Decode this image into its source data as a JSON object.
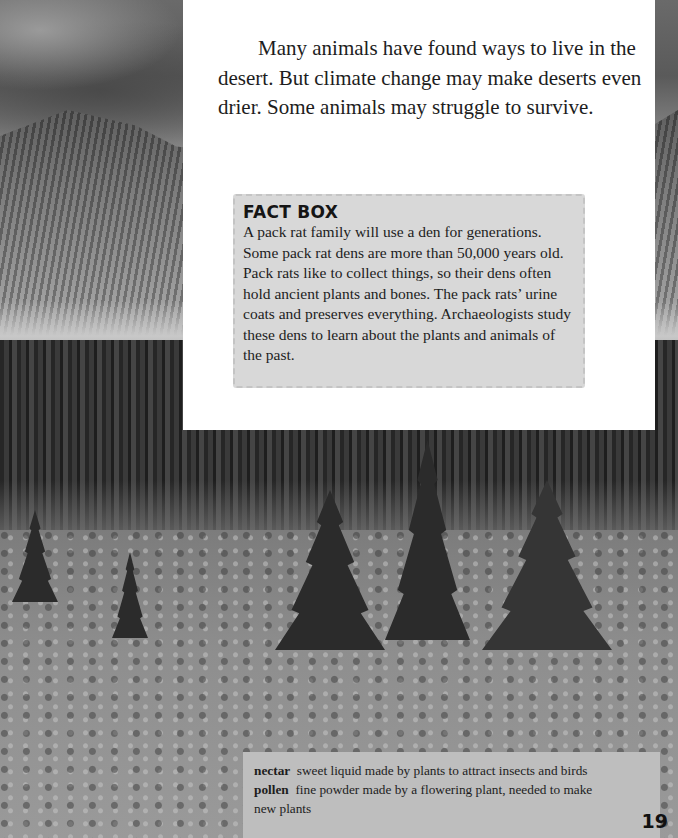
{
  "page": {
    "intro_paragraph": "Many animals have found ways to live in the desert. But climate change may make deserts even drier. Some animals may struggle to survive.",
    "fact_box": {
      "title": "FACT BOX",
      "body": "A pack rat family will use a den for generations. Some pack rat dens are more than 50,000 years old. Pack rats like to collect things, so their dens often hold ancient plants and bones. The pack rats’ urine coats and preserves everything. Archaeologists study these dens to learn about the plants and animals of the past."
    },
    "glossary": [
      {
        "term": "nectar",
        "definition": "sweet liquid made by plants to attract insects and birds"
      },
      {
        "term": "pollen",
        "definition": "fine powder made by a flowering plant, needed to make"
      }
    ],
    "glossary_continuation": "new plants",
    "page_number": "19"
  },
  "photo": {
    "description": "Black-and-white photo of a mountain meadow with evergreen trees, rocky slopes and cloudy sky"
  },
  "colors": {
    "panel_bg": "#ffffff",
    "fact_box_bg": "#d8d8d8",
    "glossary_bg": "#bebebe",
    "text": "#1d1d1d"
  }
}
